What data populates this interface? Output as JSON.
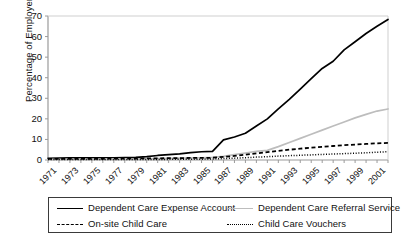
{
  "chart_data": {
    "type": "line",
    "title": "",
    "xlabel": "",
    "ylabel": "Percentage of Employers",
    "ylim": [
      0,
      70
    ],
    "yticks": [
      0,
      10,
      20,
      30,
      40,
      50,
      60,
      70
    ],
    "xlim": [
      1971,
      2002
    ],
    "xticks": [
      1971,
      1973,
      1975,
      1977,
      1979,
      1981,
      1983,
      1985,
      1987,
      1989,
      1991,
      1993,
      1995,
      1997,
      1999,
      2001
    ],
    "grid": false,
    "legend_position": "below-plot",
    "x": [
      1971,
      1972,
      1973,
      1974,
      1975,
      1976,
      1977,
      1978,
      1979,
      1980,
      1981,
      1982,
      1983,
      1984,
      1985,
      1986,
      1987,
      1988,
      1989,
      1990,
      1991,
      1992,
      1993,
      1994,
      1995,
      1996,
      1997,
      1998,
      1999,
      2000,
      2001,
      2002
    ],
    "series": [
      {
        "name": "Dependent Care Expense Account",
        "color": "#000000",
        "style": "solid",
        "values": [
          0.8,
          0.9,
          1.0,
          1.0,
          1.0,
          1.1,
          1.1,
          1.2,
          1.3,
          1.6,
          2.2,
          2.6,
          3.0,
          3.6,
          4.0,
          4.2,
          9.8,
          11.2,
          13.0,
          16.5,
          20.0,
          24.8,
          29.5,
          34.5,
          39.5,
          44.5,
          48.0,
          53.5,
          57.5,
          61.5,
          65.0,
          68.3
        ]
      },
      {
        "name": "Dependent Care Referral Service",
        "color": "#bdbdbd",
        "style": "solid",
        "values": [
          0.3,
          0.3,
          0.4,
          0.4,
          0.4,
          0.4,
          0.5,
          0.5,
          0.5,
          0.6,
          0.7,
          0.8,
          0.9,
          1.0,
          1.1,
          1.3,
          1.8,
          2.6,
          3.4,
          4.2,
          4.7,
          6.5,
          8.5,
          10.5,
          12.5,
          14.5,
          16.5,
          18.5,
          20.5,
          22.2,
          23.8,
          24.8
        ]
      },
      {
        "name": "On-site Child Care",
        "color": "#000000",
        "style": "dashed",
        "values": [
          0.5,
          0.5,
          0.5,
          0.6,
          0.6,
          0.6,
          0.7,
          0.7,
          0.7,
          0.8,
          0.8,
          0.9,
          0.9,
          1.0,
          1.0,
          1.1,
          1.5,
          2.0,
          2.6,
          3.2,
          3.8,
          4.4,
          5.0,
          5.5,
          6.0,
          6.4,
          6.8,
          7.2,
          7.5,
          7.8,
          8.1,
          8.3
        ]
      },
      {
        "name": "Child Care Vouchers",
        "color": "#000000",
        "style": "dotted",
        "values": [
          0.2,
          0.2,
          0.2,
          0.2,
          0.2,
          0.2,
          0.2,
          0.3,
          0.3,
          0.3,
          0.3,
          0.3,
          0.4,
          0.4,
          0.4,
          0.5,
          0.7,
          0.9,
          1.1,
          1.4,
          1.6,
          1.9,
          2.1,
          2.3,
          2.5,
          2.7,
          2.9,
          3.1,
          3.3,
          3.5,
          3.8,
          4.0
        ]
      }
    ]
  },
  "axis": {
    "y_title": "Percentage of Employers",
    "y_tick_labels": [
      "70",
      "60",
      "50",
      "40",
      "30",
      "20",
      "10",
      "0"
    ],
    "x_tick_labels": [
      "1971",
      "1973",
      "1975",
      "1977",
      "1979",
      "1981",
      "1983",
      "1985",
      "1987",
      "1989",
      "1991",
      "1993",
      "1995",
      "1997",
      "1999",
      "2001"
    ]
  },
  "legend": {
    "items": [
      {
        "label": "Dependent Care Expense Account",
        "marker": "solid-black-line-icon"
      },
      {
        "label": "Dependent Care Referral Service",
        "marker": "solid-gray-line-icon"
      },
      {
        "label": "On-site Child Care",
        "marker": "dashed-black-line-icon"
      },
      {
        "label": "Child Care Vouchers",
        "marker": "dotted-black-line-icon"
      }
    ]
  },
  "colors": {
    "series_primary": "#000000",
    "series_secondary": "#bdbdbd",
    "axis": "#9a9a9a",
    "text": "#111111"
  }
}
